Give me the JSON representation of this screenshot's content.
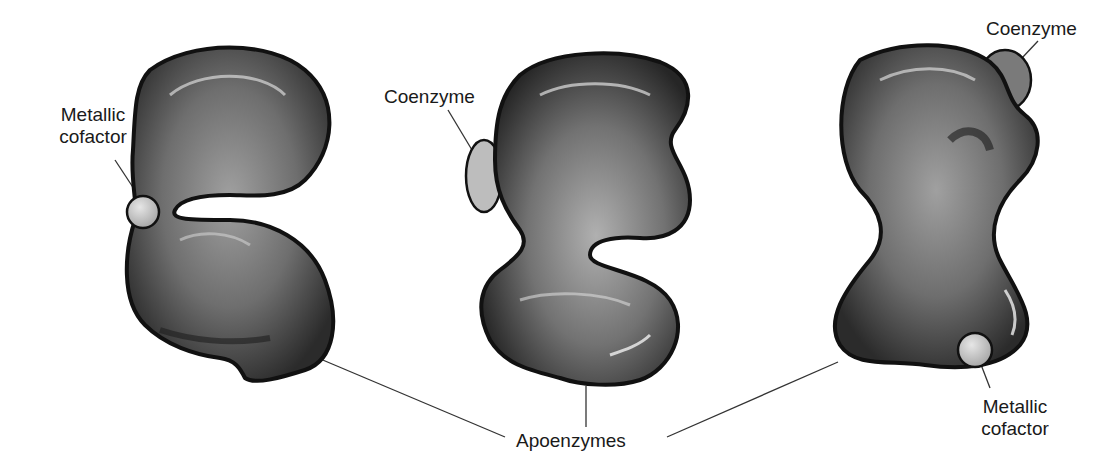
{
  "diagram": {
    "type": "labeled-illustration",
    "enzymes": [
      {
        "id": "left",
        "cofactor": "metallic",
        "cofactor_label": "Metallic\ncofactor"
      },
      {
        "id": "middle",
        "cofactor": "coenzyme",
        "cofactor_label": "Coenzyme"
      },
      {
        "id": "right",
        "cofactors": [
          "coenzyme",
          "metallic"
        ]
      }
    ],
    "colors": {
      "body_dark": "#2b2b2b",
      "body_mid": "#6e6e6e",
      "body_light": "#a0a0a0",
      "highlight": "#e8e8e8",
      "cofactor_fill": "#c8c8c8",
      "coenzyme_fill": "#bdbdbd",
      "coenzyme_dark_fill": "#7a7a7a",
      "leader_line": "#333333"
    }
  },
  "labels": {
    "metallic_left_line1": "Metallic",
    "metallic_left_line2": "cofactor",
    "coenzyme_middle": "Coenzyme",
    "coenzyme_right": "Coenzyme",
    "metallic_right_line1": "Metallic",
    "metallic_right_line2": "cofactor",
    "apoenzymes": "Apoenzymes"
  }
}
